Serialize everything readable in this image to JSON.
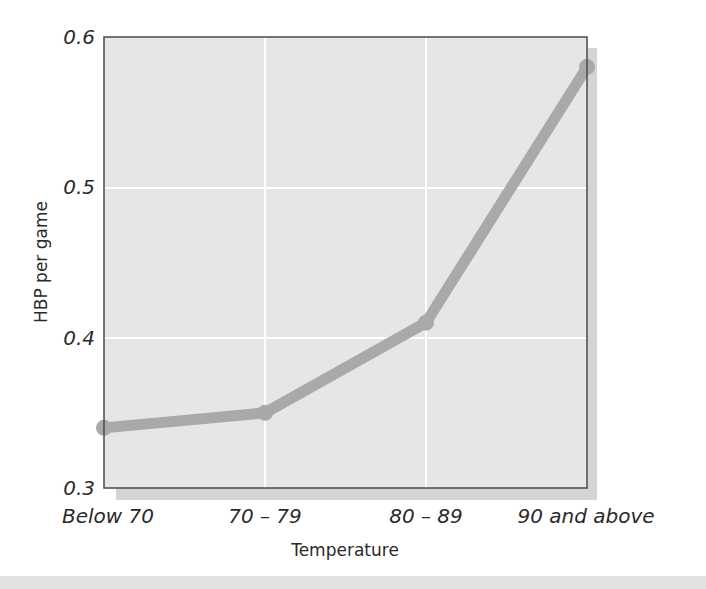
{
  "chart_data": {
    "type": "line",
    "title": "",
    "xlabel": "Temperature",
    "ylabel": "HBP per game",
    "categories": [
      "Below 70",
      "70 – 79",
      "80 – 89",
      "90 and above"
    ],
    "series": [
      {
        "name": "HBP per game",
        "values": [
          0.34,
          0.35,
          0.41,
          0.58
        ]
      }
    ],
    "ylim": [
      0.3,
      0.6
    ],
    "yticks": [
      0.3,
      0.4,
      0.5,
      0.6
    ],
    "ytick_labels": [
      "0.3",
      "0.4",
      "0.5",
      "0.6"
    ],
    "grid": true,
    "legend": null
  },
  "colors": {
    "plot_background": "#e6e6e6",
    "plot_shadow": "#d2d2d2",
    "gridline": "#ffffff",
    "line": "#a9a9a9",
    "frame": "#4a4a4a",
    "text": "#2a2a2a"
  }
}
